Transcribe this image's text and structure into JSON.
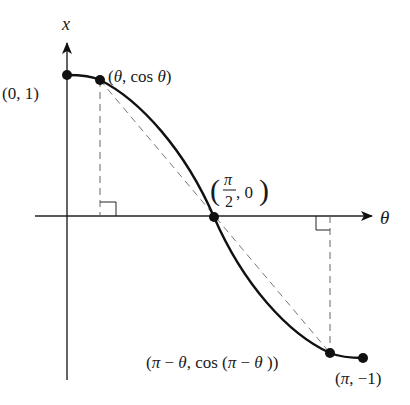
{
  "diagram": {
    "type": "function-plot",
    "axes": {
      "vertical_label": "x",
      "horizontal_label": "θ"
    },
    "points": [
      {
        "id": "start",
        "label": "(0, 1)"
      },
      {
        "id": "theta",
        "label_open": "(",
        "label_theta": "θ",
        "label_mid": ", cos ",
        "label_theta2": "θ",
        "label_close": ")"
      },
      {
        "id": "mid",
        "label_num": "π",
        "label_den": "2",
        "label_rest": ", 0"
      },
      {
        "id": "pi_minus_theta",
        "label_a": "(",
        "label_pi": "π",
        "label_b": " − ",
        "label_theta": "θ",
        "label_c": ", cos (",
        "label_pi2": "π",
        "label_d": " − ",
        "label_theta2": "θ",
        "label_e": " ))"
      },
      {
        "id": "end",
        "label_a": "(",
        "label_pi": "π",
        "label_b": ", −1)"
      }
    ],
    "annotations": [
      "dashed vertical from (θ, cos θ) to θ-axis with right-angle marker",
      "dashed vertical from (π−θ, cos(π−θ)) to θ-axis with right-angle marker",
      "dashed chord from (θ, cos θ) through (π/2, 0) to (π−θ, cos(π−θ))"
    ],
    "colors": {
      "ink": "#111111",
      "dashed": "#777777"
    }
  }
}
